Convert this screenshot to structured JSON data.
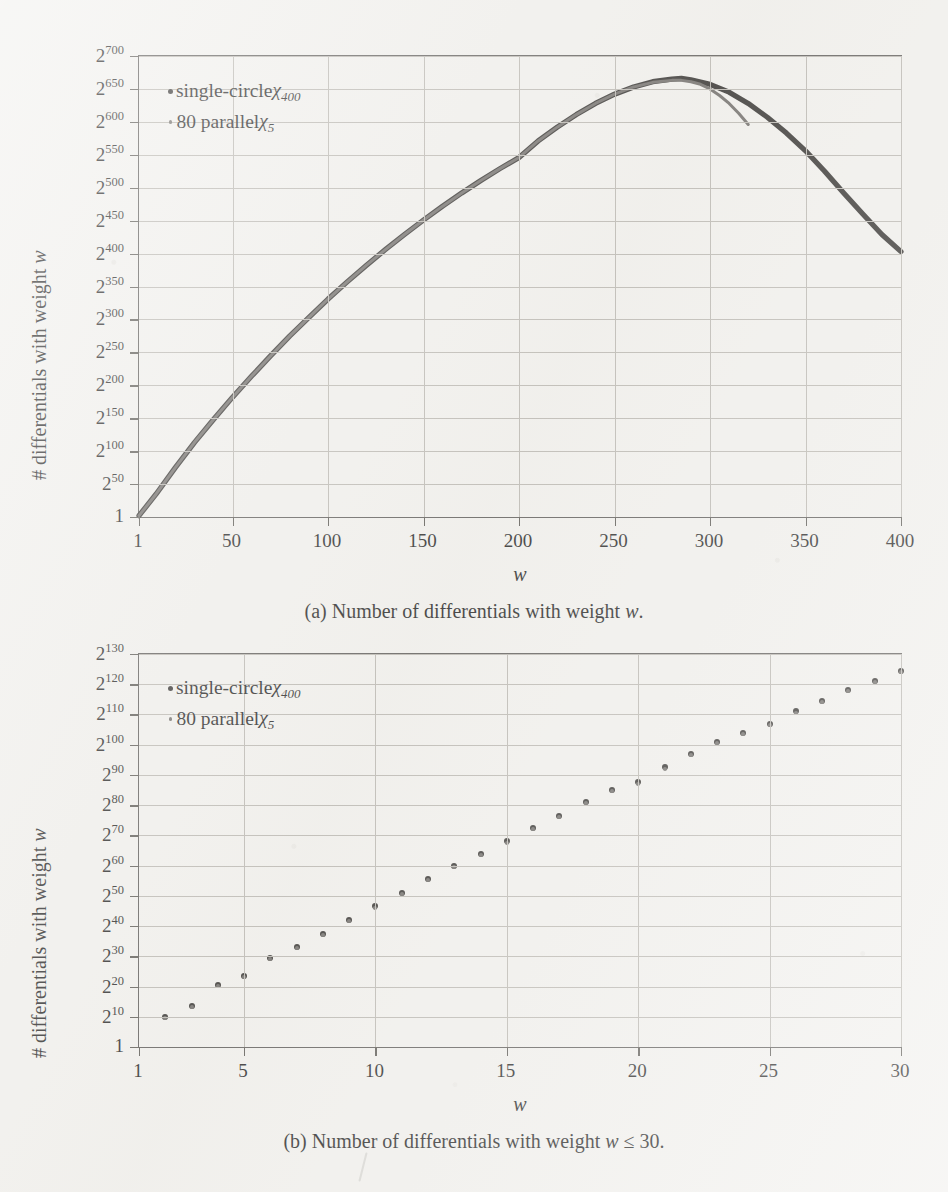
{
  "page": {
    "running_head": "",
    "background_color": "#f2f1ee",
    "ink_color": "#2b2927",
    "grid_color": "#b9b6b0"
  },
  "figure": {
    "panels": [
      {
        "id": "panel-a",
        "caption": "(a) Number of differentials with weight w.",
        "caption_prefix": "(a) Number of differentials with weight",
        "caption_var": "w",
        "caption_suffix": ".",
        "legend": [
          {
            "marker": "big-dot",
            "label_prefix": "single-circle ",
            "chi": "χ",
            "sub": "400"
          },
          {
            "marker": "small-dot",
            "label_prefix": "80 parallel ",
            "chi": "χ",
            "sub": "5"
          }
        ],
        "axes": {
          "xlabel": "w",
          "ylabel_prefix": "# differentials with weight ",
          "ylabel_var": "w",
          "xticks": [
            1,
            50,
            100,
            150,
            200,
            250,
            300,
            350,
            400
          ],
          "xlim": [
            1,
            400
          ],
          "yticks": [
            "1",
            "2^50",
            "2^100",
            "2^150",
            "2^200",
            "2^250",
            "2^300",
            "2^350",
            "2^400",
            "2^450",
            "2^500",
            "2^550",
            "2^600",
            "2^650",
            "2^700"
          ],
          "ytick_exponents": [
            null,
            50,
            100,
            150,
            200,
            250,
            300,
            350,
            400,
            450,
            500,
            550,
            600,
            650,
            700
          ],
          "ylim_log2": [
            0,
            700
          ],
          "grid": true
        },
        "chart_data": {
          "type": "line",
          "title": "Number of differentials with weight w",
          "xlabel": "w",
          "ylabel": "# differentials with weight w",
          "xlim": [
            1,
            400
          ],
          "ylim": [
            0,
            700
          ],
          "y_scale": "log2-exponent",
          "grid": true,
          "legend_position": "top-left-inside",
          "series": [
            {
              "name": "single-circle χ400",
              "color": "#2b2927",
              "x": [
                1,
                10,
                20,
                30,
                40,
                50,
                60,
                70,
                80,
                90,
                100,
                110,
                120,
                130,
                140,
                150,
                160,
                170,
                180,
                190,
                200,
                210,
                220,
                230,
                240,
                250,
                260,
                270,
                280,
                285,
                290,
                300,
                310,
                320,
                330,
                340,
                350,
                360,
                370,
                380,
                390,
                400
              ],
              "y_exponent": [
                2,
                35,
                75,
                113,
                148,
                182,
                214,
                245,
                275,
                303,
                331,
                357,
                382,
                406,
                429,
                451,
                472,
                492,
                511,
                529,
                546,
                571,
                592,
                611,
                628,
                642,
                653,
                661,
                665,
                666,
                664,
                657,
                645,
                628,
                607,
                583,
                556,
                525,
                492,
                460,
                429,
                403
              ]
            },
            {
              "name": "80 parallel χ5",
              "color": "#6b6865",
              "x": [
                1,
                10,
                20,
                30,
                40,
                50,
                60,
                70,
                80,
                90,
                100,
                110,
                120,
                130,
                140,
                150,
                160,
                170,
                180,
                190,
                200,
                210,
                220,
                230,
                240,
                250,
                260,
                270,
                280,
                285,
                290,
                295,
                300,
                305,
                310,
                315,
                320
              ],
              "y_exponent": [
                2,
                35,
                75,
                113,
                148,
                182,
                214,
                245,
                275,
                303,
                331,
                357,
                382,
                406,
                429,
                451,
                472,
                492,
                511,
                529,
                546,
                571,
                592,
                611,
                628,
                642,
                653,
                660,
                663,
                663,
                661,
                657,
                650,
                640,
                628,
                613,
                596
              ]
            }
          ]
        }
      },
      {
        "id": "panel-b",
        "caption": "(b) Number of differentials with weight w ≤ 30.",
        "caption_prefix": "(b) Number of differentials with weight",
        "caption_var": "w",
        "caption_suffix": "≤ 30.",
        "legend": [
          {
            "marker": "big-dot",
            "label_prefix": "single-circle ",
            "chi": "χ",
            "sub": "400"
          },
          {
            "marker": "small-dot",
            "label_prefix": "80 parallel ",
            "chi": "χ",
            "sub": "5"
          }
        ],
        "axes": {
          "xlabel": "w",
          "ylabel_prefix": "# differentials with weight ",
          "ylabel_var": "w",
          "xticks": [
            1,
            5,
            10,
            15,
            20,
            25,
            30
          ],
          "xlim": [
            1,
            30
          ],
          "yticks": [
            "1",
            "2^10",
            "2^20",
            "2^30",
            "2^40",
            "2^50",
            "2^60",
            "2^70",
            "2^80",
            "2^90",
            "2^100",
            "2^110",
            "2^120",
            "2^130"
          ],
          "ytick_exponents": [
            null,
            10,
            20,
            30,
            40,
            50,
            60,
            70,
            80,
            90,
            100,
            110,
            120,
            130
          ],
          "ylim_log2": [
            0,
            130
          ],
          "grid": true
        },
        "chart_data": {
          "type": "scatter",
          "title": "Number of differentials with weight w ≤ 30",
          "xlabel": "w",
          "ylabel": "# differentials with weight w",
          "xlim": [
            1,
            30
          ],
          "ylim": [
            0,
            130
          ],
          "y_scale": "log2-exponent",
          "grid": true,
          "legend_position": "top-left-inside",
          "x": [
            2,
            3,
            4,
            5,
            6,
            7,
            8,
            9,
            10,
            11,
            12,
            13,
            14,
            15,
            16,
            17,
            18,
            19,
            20,
            21,
            22,
            23,
            24,
            25,
            26,
            27,
            28,
            29,
            30
          ],
          "series": [
            {
              "name": "single-circle χ400",
              "color": "#2b2927",
              "y_exponent": [
                10,
                13.5,
                20.5,
                23.5,
                29.5,
                33,
                37.5,
                42,
                46.5,
                51,
                55.5,
                60,
                64,
                68,
                72.5,
                76.5,
                81,
                85,
                87.5,
                92.5,
                97,
                101,
                104,
                107,
                111,
                114.5,
                118,
                121,
                124.5
              ]
            },
            {
              "name": "80 parallel χ5",
              "color": "#6b6865",
              "y_exponent": [
                9.6,
                13.1,
                20.2,
                23.1,
                29.2,
                32.6,
                37.1,
                41.6,
                46.1,
                50.6,
                55.1,
                59.6,
                63.6,
                67.5,
                72.1,
                76.1,
                80.6,
                84.6,
                87.1,
                92.1,
                96.6,
                100.6,
                103.6,
                106.6,
                110.6,
                114.1,
                117.6,
                120.6,
                124.1
              ]
            }
          ]
        }
      }
    ]
  }
}
